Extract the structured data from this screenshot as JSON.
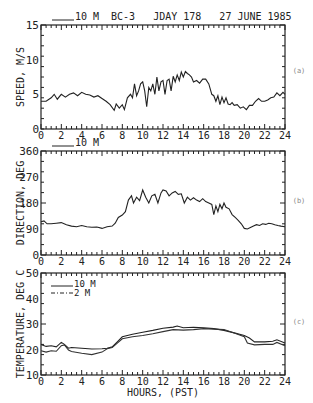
{
  "header": {
    "legend_10m": "10 M",
    "title": "BC-3   JDAY 178   27 JUNE 1985"
  },
  "chart_data": [
    {
      "type": "line",
      "panel_label": "(a)",
      "title": "BC-3 JDAY 178 27 JUNE 1985",
      "xlabel": "",
      "ylabel": "SPEED, M/S",
      "xlim": [
        0,
        24
      ],
      "ylim": [
        0,
        15
      ],
      "yticks": [
        "0",
        "5",
        "10",
        "15"
      ],
      "xticks": [
        "0",
        "2",
        "4",
        "6",
        "8",
        "10",
        "12",
        "14",
        "16",
        "18",
        "20",
        "22",
        "24"
      ],
      "legend": [
        "10 M"
      ],
      "series": [
        {
          "name": "10 M",
          "x": [
            0,
            0.5,
            1,
            1.3,
            1.6,
            2,
            2.4,
            2.8,
            3.2,
            3.6,
            4,
            4.4,
            4.8,
            5.2,
            5.6,
            6,
            6.4,
            6.8,
            7.2,
            7.4,
            7.7,
            8,
            8.2,
            8.5,
            8.8,
            9,
            9.2,
            9.4,
            9.6,
            9.8,
            10,
            10.2,
            10.4,
            10.6,
            10.8,
            11,
            11.2,
            11.4,
            11.6,
            11.8,
            12,
            12.2,
            12.4,
            12.6,
            12.8,
            13,
            13.2,
            13.4,
            13.6,
            13.8,
            14,
            14.2,
            14.4,
            14.6,
            14.8,
            15,
            15.3,
            15.6,
            15.9,
            16.2,
            16.5,
            16.8,
            17,
            17.2,
            17.4,
            17.6,
            17.8,
            18,
            18.2,
            18.4,
            18.6,
            18.8,
            19,
            19.3,
            19.6,
            19.9,
            20.2,
            20.5,
            20.8,
            21.1,
            21.4,
            21.7,
            22,
            22.3,
            22.6,
            22.9,
            23.2,
            23.5,
            23.8,
            24
          ],
          "values": [
            4.0,
            4.0,
            4.5,
            5.0,
            4.3,
            5.0,
            4.6,
            5.0,
            5.2,
            4.8,
            5.3,
            5.0,
            4.9,
            4.6,
            4.8,
            4.4,
            4.0,
            3.5,
            2.7,
            3.6,
            3.0,
            3.5,
            2.8,
            4.5,
            5.0,
            4.5,
            6.5,
            4.8,
            5.5,
            6.5,
            6.8,
            5.5,
            3.2,
            6.0,
            5.5,
            6.5,
            5.0,
            7.5,
            5.5,
            6.8,
            7.0,
            5.0,
            7.0,
            7.2,
            5.5,
            7.6,
            6.8,
            7.8,
            7.0,
            8.2,
            7.5,
            8.3,
            8.0,
            7.8,
            7.5,
            6.8,
            7.0,
            6.6,
            7.2,
            7.2,
            6.5,
            5.0,
            4.8,
            4.0,
            4.8,
            3.5,
            4.6,
            3.8,
            4.5,
            3.6,
            3.5,
            3.8,
            3.4,
            3.5,
            3.0,
            3.2,
            2.8,
            3.4,
            3.4,
            4.0,
            4.4,
            4.0,
            4.0,
            4.2,
            4.5,
            4.6,
            5.2,
            4.8,
            5.3,
            5.0
          ]
        }
      ]
    },
    {
      "type": "line",
      "panel_label": "(b)",
      "title": "",
      "xlabel": "",
      "ylabel": "DIRECTION, DEG",
      "xlim": [
        0,
        24
      ],
      "ylim": [
        0,
        360
      ],
      "yticks": [
        "0",
        "90",
        "180",
        "270",
        "360"
      ],
      "xticks": [
        "0",
        "2",
        "4",
        "6",
        "8",
        "10",
        "12",
        "14",
        "16",
        "18",
        "20",
        "22",
        "24"
      ],
      "legend": [
        "10 M"
      ],
      "series": [
        {
          "name": "10 M",
          "x": [
            0,
            0.3,
            0.6,
            1,
            1.5,
            2,
            2.5,
            3,
            3.5,
            4,
            4.5,
            5,
            5.5,
            6,
            6.5,
            7,
            7.3,
            7.6,
            8,
            8.3,
            8.6,
            8.9,
            9.1,
            9.4,
            9.7,
            10,
            10.3,
            10.6,
            10.9,
            11.2,
            11.5,
            11.8,
            12,
            12.3,
            12.6,
            12.9,
            13.2,
            13.5,
            13.8,
            14.1,
            14.4,
            14.7,
            15,
            15.3,
            15.6,
            15.9,
            16.2,
            16.5,
            16.8,
            17,
            17.2,
            17.4,
            17.6,
            17.8,
            18,
            18.2,
            18.5,
            18.8,
            19.1,
            19.4,
            19.7,
            20,
            20.3,
            20.6,
            20.9,
            21.2,
            21.5,
            21.8,
            22.1,
            22.4,
            22.7,
            23,
            23.3,
            23.6,
            24
          ],
          "values": [
            115,
            118,
            108,
            108,
            110,
            112,
            105,
            100,
            98,
            102,
            98,
            96,
            97,
            92,
            98,
            100,
            110,
            130,
            138,
            150,
            190,
            205,
            180,
            200,
            188,
            225,
            200,
            180,
            205,
            210,
            180,
            215,
            225,
            222,
            205,
            215,
            220,
            210,
            212,
            180,
            200,
            190,
            198,
            190,
            185,
            195,
            185,
            180,
            175,
            140,
            170,
            150,
            175,
            160,
            180,
            165,
            160,
            140,
            130,
            120,
            108,
            92,
            90,
            95,
            100,
            105,
            102,
            108,
            106,
            110,
            108,
            105,
            102,
            100,
            98
          ]
        }
      ]
    },
    {
      "type": "line",
      "panel_label": "(c)",
      "title": "",
      "xlabel": "HOURS, (PST)",
      "ylabel": "TEMPERATURE, DEG C",
      "xlim": [
        0,
        24
      ],
      "ylim": [
        10,
        50
      ],
      "yticks": [
        "10",
        "20",
        "30",
        "40",
        "50"
      ],
      "xticks": [
        "0",
        "2",
        "4",
        "6",
        "8",
        "10",
        "12",
        "14",
        "16",
        "18",
        "20",
        "22",
        "24"
      ],
      "legend": [
        "10 M",
        "2 M"
      ],
      "series": [
        {
          "name": "10 M",
          "style": "solid",
          "x": [
            0,
            0.5,
            1,
            1.5,
            2,
            2.3,
            2.7,
            3,
            4,
            5,
            6,
            6.5,
            7,
            7.5,
            8,
            9,
            10,
            11,
            12,
            13,
            13.4,
            14,
            15,
            16,
            17,
            18,
            19,
            20,
            20.5,
            21,
            22,
            22.8,
            23.2,
            24
          ],
          "values": [
            22.0,
            21.2,
            21.5,
            21.0,
            22.8,
            22.0,
            20.5,
            20.8,
            20.5,
            20.2,
            20.3,
            20.5,
            21.0,
            23.0,
            25.0,
            26.0,
            26.8,
            27.5,
            28.3,
            28.8,
            29.2,
            28.5,
            28.7,
            28.5,
            28.2,
            27.5,
            26.5,
            25.5,
            24.5,
            23.0,
            23.0,
            23.2,
            23.8,
            22.5
          ]
        },
        {
          "name": "2 M",
          "style": "dash-dot",
          "x": [
            0,
            0.5,
            1,
            1.5,
            2,
            2.3,
            2.7,
            3,
            4,
            5,
            6,
            6.5,
            7,
            7.5,
            8,
            9,
            10,
            11,
            12,
            13,
            14,
            15,
            16,
            17,
            18,
            19,
            20,
            20.3,
            21,
            22,
            22.8,
            23.2,
            24
          ],
          "values": [
            19.5,
            19.0,
            19.5,
            19.3,
            21.5,
            21.8,
            19.8,
            19.2,
            18.5,
            18.0,
            19.0,
            20.3,
            20.8,
            22.5,
            24.2,
            25.0,
            25.5,
            26.2,
            27.0,
            27.8,
            27.6,
            27.8,
            28.2,
            28.0,
            27.8,
            26.5,
            25.0,
            22.5,
            21.8,
            22.0,
            22.0,
            22.8,
            21.5
          ]
        }
      ]
    }
  ]
}
